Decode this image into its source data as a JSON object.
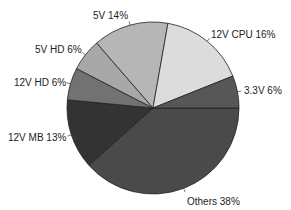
{
  "chart_data": {
    "type": "pie",
    "title": "",
    "start_angle_deg": 0,
    "direction": "clockwise",
    "slices": [
      {
        "label": "Others",
        "value": 38,
        "display": "Others 38%",
        "color": "#4a4a4a"
      },
      {
        "label": "12V MB",
        "value": 13,
        "display": "12V MB 13%",
        "color": "#333333"
      },
      {
        "label": "12V HD",
        "value": 6,
        "display": "12V HD 6%",
        "color": "#727272"
      },
      {
        "label": "5V HD",
        "value": 6,
        "display": "5V HD 6%",
        "color": "#a8a8a8"
      },
      {
        "label": "5V",
        "value": 14,
        "display": "5V 14%",
        "color": "#b6b6b6"
      },
      {
        "label": "12V CPU",
        "value": 16,
        "display": "12V CPU 16%",
        "color": "#dcdcdc"
      },
      {
        "label": "3.3V",
        "value": 6,
        "display": "3.3V 6%",
        "color": "#575757"
      }
    ],
    "categories": [
      "Others",
      "12V MB",
      "12V HD",
      "5V HD",
      "5V",
      "12V CPU",
      "3.3V"
    ],
    "values": [
      38,
      13,
      6,
      6,
      14,
      16,
      6
    ],
    "legend": "none (labels beside slices)"
  }
}
